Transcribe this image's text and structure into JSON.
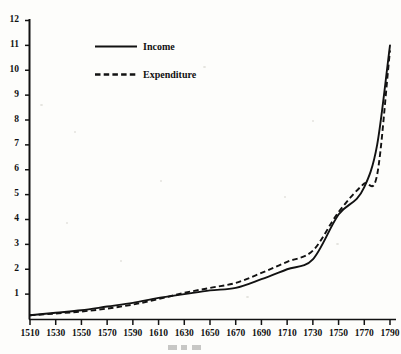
{
  "chart_data": {
    "type": "line",
    "title": "",
    "subtitle": "",
    "xlabel": "",
    "ylabel": "",
    "xlim": [
      1510,
      1790
    ],
    "ylim": [
      0,
      12
    ],
    "grid": false,
    "legend_position": "top-left-inside",
    "x_tick_labels": [
      "1510",
      "1530",
      "1550",
      "1570",
      "1590",
      "1610",
      "1630",
      "1650",
      "1670",
      "1690",
      "1710",
      "1730",
      "1750",
      "1770",
      "1790"
    ],
    "y_tick_labels": [
      "12",
      "11",
      "10",
      "9",
      "8",
      "7",
      "6",
      "5",
      "4",
      "3",
      "2",
      "1"
    ],
    "x_tick_values": [
      1510,
      1530,
      1550,
      1570,
      1590,
      1610,
      1630,
      1650,
      1670,
      1690,
      1710,
      1730,
      1750,
      1770,
      1790
    ],
    "y_tick_values": [
      12,
      11,
      10,
      9,
      8,
      7,
      6,
      5,
      4,
      3,
      2,
      1
    ],
    "x": [
      1510,
      1530,
      1550,
      1570,
      1590,
      1610,
      1630,
      1650,
      1670,
      1690,
      1710,
      1730,
      1750,
      1770,
      1780,
      1790
    ],
    "series": [
      {
        "name": "Income",
        "style": "solid",
        "color": "#121212",
        "values": [
          0.15,
          0.25,
          0.35,
          0.5,
          0.65,
          0.85,
          1.0,
          1.15,
          1.25,
          1.6,
          2.0,
          2.4,
          4.2,
          5.3,
          7.0,
          11.0
        ]
      },
      {
        "name": "Expenditure",
        "style": "dashed",
        "color": "#121212",
        "values": [
          0.15,
          0.22,
          0.3,
          0.42,
          0.58,
          0.8,
          1.05,
          1.25,
          1.45,
          1.85,
          2.3,
          2.75,
          4.3,
          5.45,
          5.8,
          10.8
        ]
      }
    ],
    "annotations": []
  },
  "legend": {
    "entries": [
      {
        "label": "Income",
        "style": "solid"
      },
      {
        "label": "Expenditure",
        "style": "dashed"
      }
    ]
  },
  "axes": {
    "y_axis_name": "value-axis",
    "x_axis_name": "year-axis"
  }
}
